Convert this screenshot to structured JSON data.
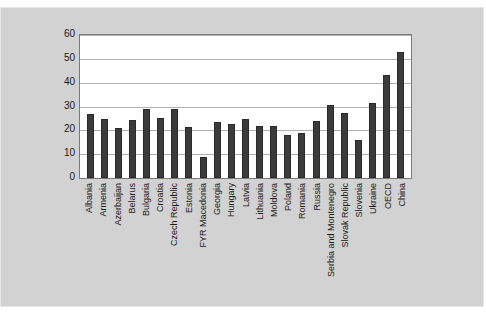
{
  "chart_data": {
    "type": "bar",
    "title": "",
    "subtitle": "",
    "xlabel": "",
    "ylabel": "",
    "ylim": [
      0,
      60
    ],
    "yticks": [
      0,
      10,
      20,
      30,
      40,
      50,
      60
    ],
    "grid": true,
    "legend": null,
    "bar_color": "#3b3b3b",
    "plot_background": "#ffffff",
    "figure_background": "#d2d2d2",
    "categories": [
      "Albania",
      "Armenia",
      "Azerbaijan",
      "Belarus",
      "Bulgaria",
      "Croatia",
      "Czech Republic",
      "Estonia",
      "FYR Macedonia",
      "Georgia",
      "Hungary",
      "Latvia",
      "Lithuania",
      "Moldova",
      "Poland",
      "Romania",
      "Russia",
      "Serbia and Montenegro",
      "Slovak Republic",
      "Slovenia",
      "Ukraine",
      "OECD",
      "China"
    ],
    "values": [
      27.0,
      24.8,
      20.8,
      24.5,
      29.0,
      25.3,
      28.8,
      21.5,
      8.8,
      23.5,
      22.5,
      24.8,
      22.0,
      22.0,
      18.0,
      19.0,
      24.0,
      30.7,
      27.2,
      16.0,
      31.3,
      43.2,
      53.0
    ]
  }
}
